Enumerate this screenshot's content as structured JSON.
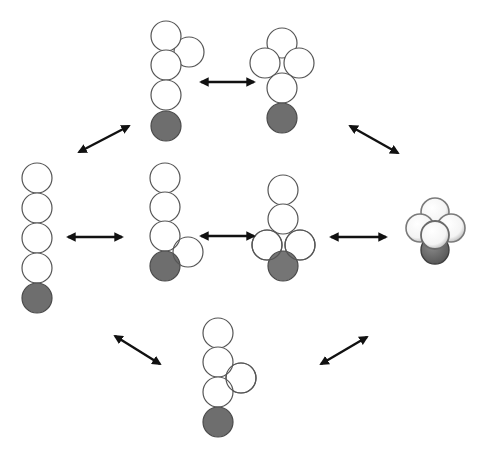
{
  "diagram": {
    "colors": {
      "open_bead": "#ffffff",
      "dark_bead": "#6e6e6e",
      "outline": "#555555",
      "arrow": "#111111"
    },
    "nodes": [
      {
        "id": "linear-chain",
        "label": "linear chain",
        "beads": 5
      },
      {
        "id": "top-branch-upper",
        "label": "branched chain (upper side bead)",
        "beads": 5
      },
      {
        "id": "top-cross",
        "label": "cross cluster",
        "beads": 5
      },
      {
        "id": "mid-branch-lower",
        "label": "branched chain (lower side bead)",
        "beads": 5
      },
      {
        "id": "mid-tee",
        "label": "T cluster",
        "beads": 5
      },
      {
        "id": "compact-3d",
        "label": "compact 3D cluster",
        "beads": 5
      },
      {
        "id": "bottom-branch-middle",
        "label": "branched chain (middle side bead)",
        "beads": 5
      }
    ],
    "edges": [
      {
        "from": "linear-chain",
        "to": "top-branch-upper",
        "type": "bidirectional"
      },
      {
        "from": "top-branch-upper",
        "to": "top-cross",
        "type": "bidirectional"
      },
      {
        "from": "top-cross",
        "to": "compact-3d",
        "type": "bidirectional"
      },
      {
        "from": "linear-chain",
        "to": "mid-branch-lower",
        "type": "bidirectional"
      },
      {
        "from": "mid-branch-lower",
        "to": "mid-tee",
        "type": "bidirectional"
      },
      {
        "from": "mid-tee",
        "to": "compact-3d",
        "type": "bidirectional"
      },
      {
        "from": "linear-chain",
        "to": "bottom-branch-middle",
        "type": "bidirectional"
      },
      {
        "from": "bottom-branch-middle",
        "to": "compact-3d",
        "type": "bidirectional"
      }
    ]
  }
}
